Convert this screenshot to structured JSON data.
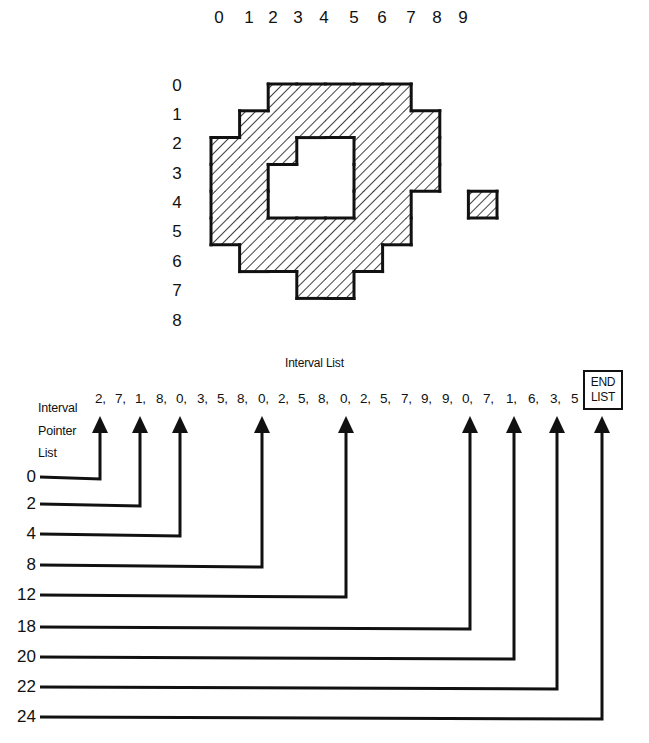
{
  "grid": {
    "column_labels": [
      "0",
      "1",
      "2",
      "3",
      "4",
      "5",
      "6",
      "7",
      "8",
      "9"
    ],
    "row_labels": [
      "0",
      "1",
      "2",
      "3",
      "4",
      "5",
      "6",
      "7",
      "8"
    ],
    "rows": [
      {
        "row": 0,
        "intervals": [
          [
            2,
            7
          ]
        ]
      },
      {
        "row": 1,
        "intervals": [
          [
            1,
            8
          ]
        ]
      },
      {
        "row": 2,
        "intervals": [
          [
            0,
            3
          ],
          [
            5,
            8
          ]
        ]
      },
      {
        "row": 3,
        "intervals": [
          [
            0,
            2
          ],
          [
            5,
            8
          ]
        ]
      },
      {
        "row": 4,
        "intervals": [
          [
            0,
            2
          ],
          [
            5,
            7
          ],
          [
            9,
            9
          ]
        ]
      },
      {
        "row": 5,
        "intervals": [
          [
            0,
            7
          ]
        ]
      },
      {
        "row": 6,
        "intervals": [
          [
            1,
            6
          ]
        ]
      },
      {
        "row": 7,
        "intervals": [
          [
            3,
            5
          ]
        ]
      }
    ],
    "fill_pattern": "diagonal-hatch",
    "line_color": "#111111"
  },
  "interval_list": {
    "title": "Interval List",
    "values": [
      "2,",
      "7,",
      "1,",
      "8,",
      "0,",
      "3,",
      "5,",
      "8,",
      "0,",
      "2,",
      "5,",
      "8,",
      "0,",
      "2,",
      "5,",
      "7,",
      "9,",
      "9,",
      "0,",
      "7,",
      "1,",
      "6,",
      "3,",
      "5"
    ],
    "end_label_line1": "END",
    "end_label_line2": "LIST"
  },
  "pointer_list": {
    "label_line1": "Interval",
    "label_line2": "Pointer",
    "label_line3": "List",
    "pointers": [
      {
        "label": "0",
        "target_index": 0
      },
      {
        "label": "2",
        "target_index": 2
      },
      {
        "label": "4",
        "target_index": 4
      },
      {
        "label": "8",
        "target_index": 8
      },
      {
        "label": "12",
        "target_index": 12
      },
      {
        "label": "18",
        "target_index": 18
      },
      {
        "label": "20",
        "target_index": 20
      },
      {
        "label": "22",
        "target_index": 22
      },
      {
        "label": "24",
        "target_index": 24
      }
    ]
  }
}
